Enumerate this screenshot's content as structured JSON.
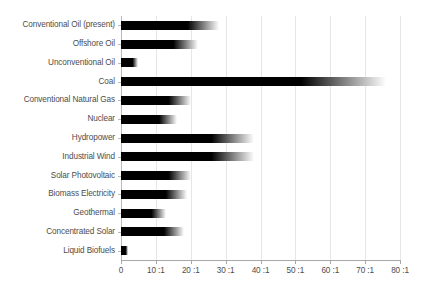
{
  "chart_data": {
    "type": "bar",
    "orientation": "horizontal",
    "title": "",
    "subtitle": "",
    "xlabel": "",
    "ylabel": "",
    "xlim": [
      0,
      80
    ],
    "grid": true,
    "legend": null,
    "tick_suffix": ":1",
    "xticks": [
      0,
      10,
      20,
      30,
      40,
      50,
      60,
      70,
      80
    ],
    "xtick_labels": [
      "0",
      "10 :1",
      "20 :1",
      "30 :1",
      "40 :1",
      "50 :1",
      "60 :1",
      "70 :1",
      "80 :1"
    ],
    "categories": [
      "Conventional Oil (present)",
      "Offshore Oil",
      "Unconventional Oil",
      "Coal",
      "Conventional Natural Gas",
      "Nuclear",
      "Hydropower",
      "Industrial Wind",
      "Solar Photovoltaic",
      "Biomass Electricity",
      "Geothermal",
      "Concentrated Solar",
      "Liquid Biofuels"
    ],
    "values": [
      28,
      22,
      5,
      76,
      20,
      16,
      38,
      38,
      20,
      19,
      13,
      18,
      2
    ],
    "colors": {
      "bar": "#000000",
      "bar_fade": "#ffffff",
      "gridline": "#e6e6e6",
      "axis": "#a8a8a8",
      "text": "#4d4d4d",
      "background": "#ffffff"
    }
  }
}
